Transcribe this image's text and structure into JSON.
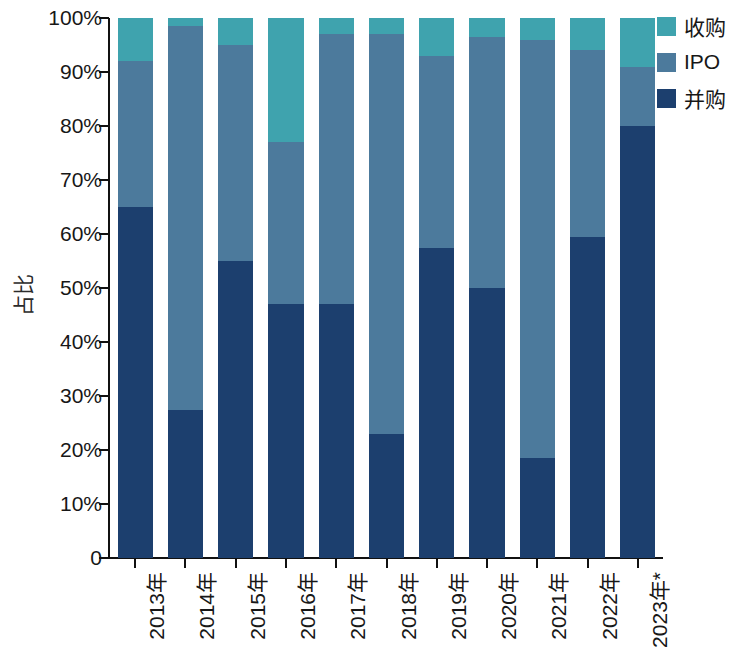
{
  "chart_data": {
    "type": "bar",
    "stacked": true,
    "stacked_mode": "percent",
    "title": "",
    "subtitle": "",
    "xlabel": "",
    "ylabel": "占比",
    "grid": false,
    "legend_position": "top-right",
    "categories": [
      "2013年",
      "2014年",
      "2015年",
      "2016年",
      "2017年",
      "2018年",
      "2019年",
      "2020年",
      "2021年",
      "2022年",
      "2023年*"
    ],
    "ylim": [
      0,
      100
    ],
    "yticks": [
      0,
      10,
      20,
      30,
      40,
      50,
      60,
      70,
      80,
      90,
      100
    ],
    "ytick_labels": [
      "0",
      "10%",
      "20%",
      "30%",
      "40%",
      "50%",
      "60%",
      "70%",
      "80%",
      "90%",
      "100%"
    ],
    "series": [
      {
        "name": "并购",
        "color": "#1c3f6e",
        "values": [
          65.0,
          27.5,
          55.0,
          47.0,
          47.0,
          23.0,
          57.5,
          50.0,
          18.5,
          59.5,
          80.0
        ]
      },
      {
        "name": "IPO",
        "color": "#4c7a9c",
        "values": [
          27.0,
          71.0,
          40.0,
          30.0,
          50.0,
          74.0,
          35.5,
          46.5,
          77.5,
          34.5,
          11.0
        ]
      },
      {
        "name": "收购",
        "color": "#3fa3ae",
        "values": [
          8.0,
          1.5,
          5.0,
          23.0,
          3.0,
          3.0,
          7.0,
          3.5,
          4.0,
          6.0,
          9.0
        ]
      }
    ],
    "cumulative_tops": {
      "并购": [
        65.0,
        27.5,
        55.0,
        47.0,
        47.0,
        23.0,
        57.5,
        50.0,
        18.5,
        59.5,
        80.0
      ],
      "IPO": [
        92.0,
        98.5,
        95.0,
        77.0,
        97.0,
        97.0,
        93.0,
        96.5,
        96.0,
        94.0,
        91.0
      ],
      "收购": [
        100,
        100,
        100,
        100,
        100,
        100,
        100,
        100,
        100,
        100,
        100
      ]
    }
  },
  "legend": {
    "items": [
      {
        "label": "收购",
        "color": "#3fa3ae"
      },
      {
        "label": "IPO",
        "color": "#4c7a9c"
      },
      {
        "label": "并购",
        "color": "#1c3f6e"
      }
    ]
  },
  "colors": {
    "acquisition_teal": "#3fa3ae",
    "ipo_blue": "#4c7a9c",
    "merger_navy": "#1c3f6e",
    "axis": "#111111",
    "text": "#171717",
    "background": "#ffffff"
  }
}
